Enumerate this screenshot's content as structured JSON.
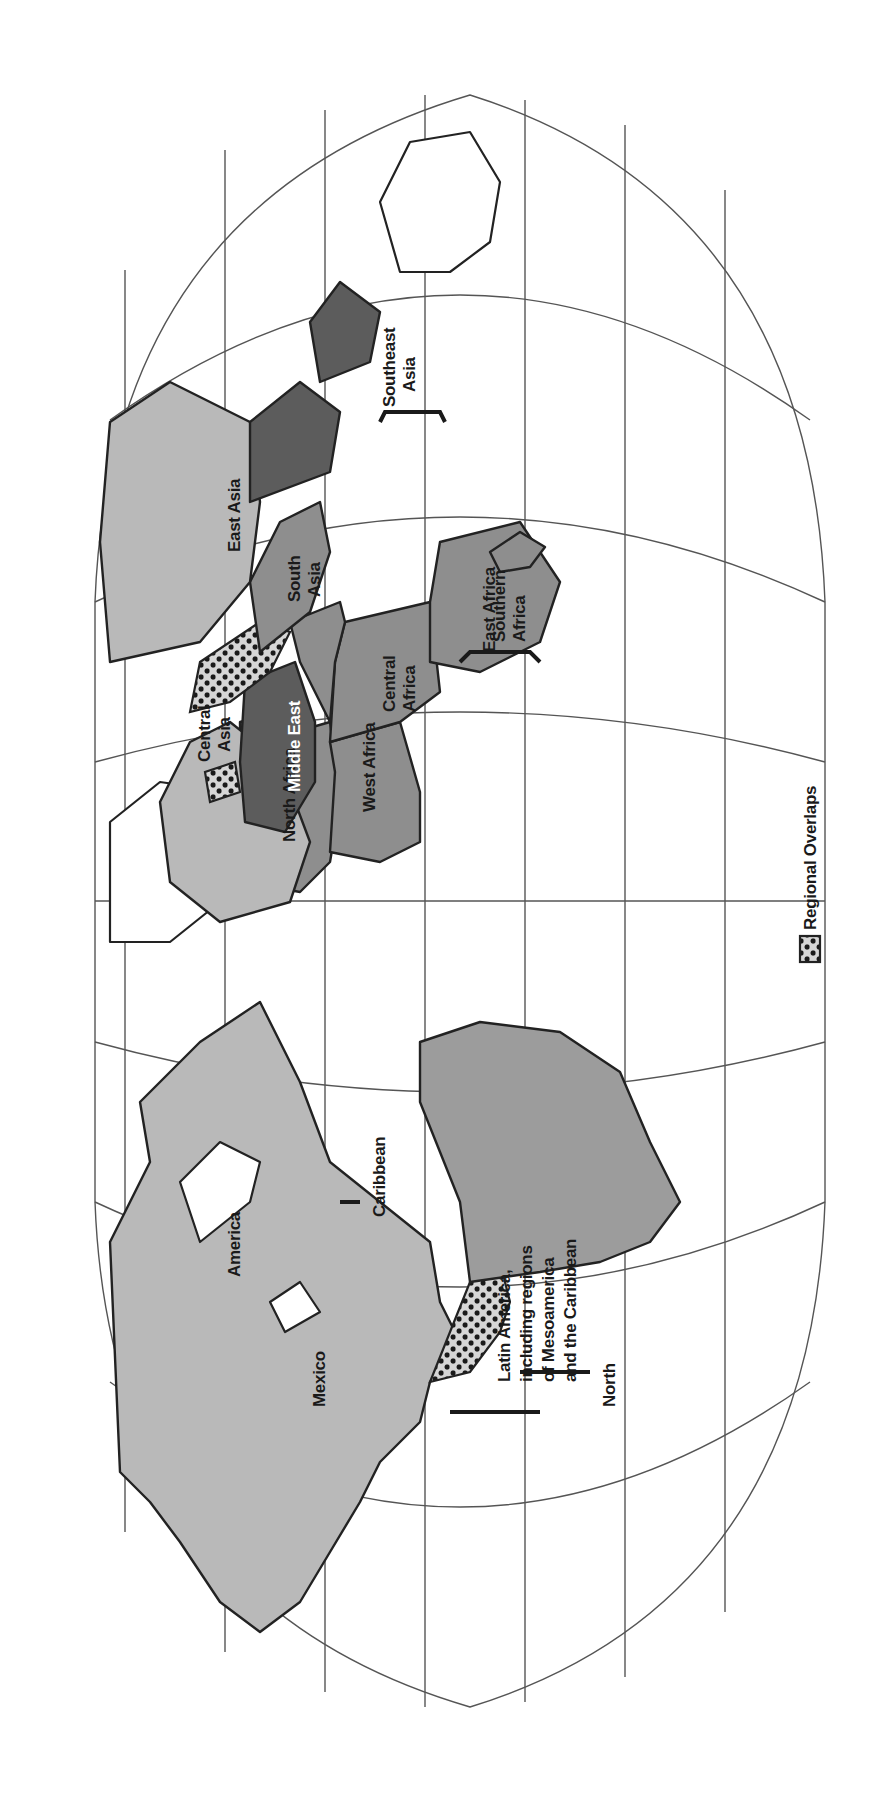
{
  "map": {
    "type": "world regions map",
    "orientation": "rotated 90 degrees (north to the left)",
    "colors": {
      "background": "#ffffff",
      "light_region": "#b9b9b9",
      "medium_region": "#8e8e8e",
      "dark_region": "#5c5c5c",
      "outline": "#222222"
    }
  },
  "regions": {
    "north_america": "North America",
    "north_america_line2": "America",
    "north_america_line1": "North",
    "mexico": "Mexico",
    "caribbean": "Caribbean",
    "latin_america_line1": "Latin America,",
    "latin_america_line2": "including regions",
    "latin_america_line3": "of Mesoamerica",
    "latin_america_line4": "and the Caribbean",
    "north_africa": "North Africa",
    "west_africa": "West Africa",
    "central_africa_line1": "Central",
    "central_africa_line2": "Africa",
    "southern_africa_line1": "Southern",
    "southern_africa_line2": "Africa",
    "east_africa": "East Africa",
    "middle_east": "Middle East",
    "central_asia_line1": "Central",
    "central_asia_line2": "Asia",
    "south_asia_line1": "South",
    "south_asia_line2": "Asia",
    "east_asia": "East Asia",
    "southeast_asia_line1": "Southeast",
    "southeast_asia_line2": "Asia"
  },
  "legend": {
    "overlap_label": "Regional Overlaps",
    "overlap_icon": "dotted-pattern-swatch"
  }
}
